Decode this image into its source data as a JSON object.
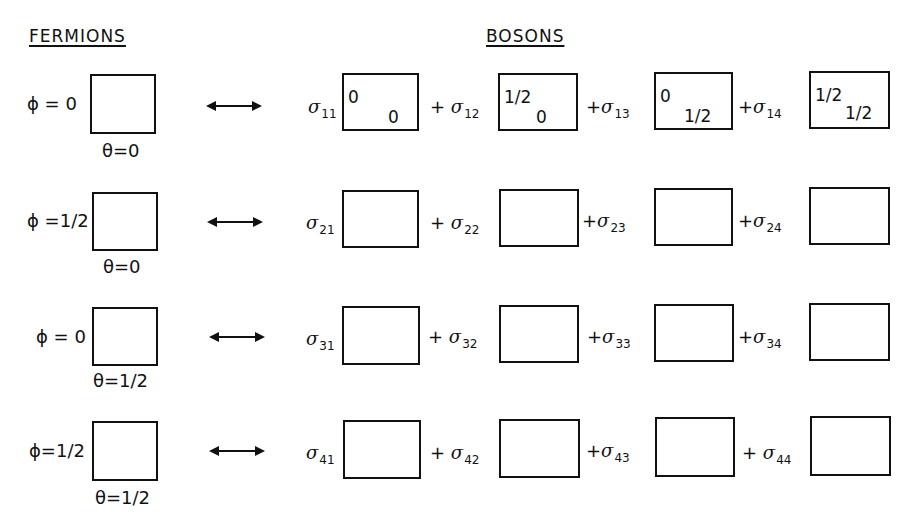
{
  "headings": {
    "fermions": "FERMIONS",
    "bosons": "BOSONS"
  },
  "rows": [
    {
      "fermion": {
        "phi_label": "ϕ = 0",
        "theta_label": "θ=0"
      },
      "arrow": "double-headed-arrow",
      "bosons": [
        {
          "coef": "σ",
          "sub": "11",
          "plus": "",
          "top_left": "0",
          "bottom_right": "0"
        },
        {
          "coef": "σ",
          "sub": "12",
          "plus": "+",
          "top_left": "1/2",
          "bottom_right": "0"
        },
        {
          "coef": "σ",
          "sub": "13",
          "plus": "+",
          "top_left": "0",
          "bottom_right": "1/2"
        },
        {
          "coef": "σ",
          "sub": "14",
          "plus": "+",
          "top_left": "1/2",
          "bottom_right": "1/2"
        }
      ]
    },
    {
      "fermion": {
        "phi_label": "ϕ =1/2",
        "theta_label": "θ=0"
      },
      "arrow": "double-headed-arrow",
      "bosons": [
        {
          "coef": "σ",
          "sub": "21",
          "plus": ""
        },
        {
          "coef": "σ",
          "sub": "22",
          "plus": "+"
        },
        {
          "coef": "σ",
          "sub": "23",
          "plus": "+"
        },
        {
          "coef": "σ",
          "sub": "24",
          "plus": "+"
        }
      ]
    },
    {
      "fermion": {
        "phi_label": "ϕ = 0",
        "theta_label": "θ=1/2"
      },
      "arrow": "double-headed-arrow",
      "bosons": [
        {
          "coef": "σ",
          "sub": "31",
          "plus": ""
        },
        {
          "coef": "σ",
          "sub": "32",
          "plus": "+"
        },
        {
          "coef": "σ",
          "sub": "33",
          "plus": "+"
        },
        {
          "coef": "σ",
          "sub": "34",
          "plus": "+"
        }
      ]
    },
    {
      "fermion": {
        "phi_label": "ϕ=1/2",
        "theta_label": "θ=1/2"
      },
      "arrow": "double-headed-arrow",
      "bosons": [
        {
          "coef": "σ",
          "sub": "41",
          "plus": ""
        },
        {
          "coef": "σ",
          "sub": "42",
          "plus": "+"
        },
        {
          "coef": "σ",
          "sub": "43",
          "plus": "+"
        },
        {
          "coef": "σ",
          "sub": "44",
          "plus": "+"
        }
      ]
    }
  ]
}
